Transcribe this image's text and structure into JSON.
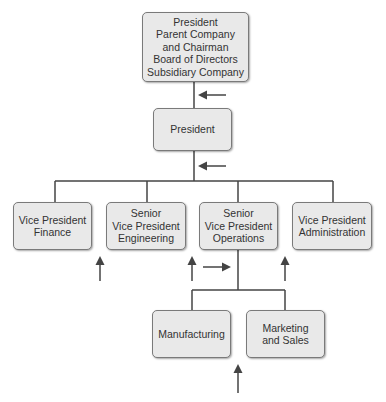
{
  "colors": {
    "box_fill": "#e9e9e9",
    "box_border": "#7a7a7a",
    "line": "#444444",
    "text": "#333333"
  },
  "boxes": {
    "chairman": {
      "label": "President\nParent Company\nand Chairman\nBoard of Directors\nSubsidiary Company"
    },
    "president": {
      "label": "President"
    },
    "vp_finance": {
      "label": "Vice President\nFinance"
    },
    "svp_engineering": {
      "label": "Senior\nVice President\nEngineering"
    },
    "svp_operations": {
      "label": "Senior\nVice President\nOperations"
    },
    "vp_administration": {
      "label": "Vice President\nAdministration"
    },
    "manufacturing": {
      "label": "Manufacturing"
    },
    "marketing_sales": {
      "label": "Marketing\nand Sales"
    }
  },
  "arrows": [
    {
      "direction": "left",
      "near": "chairman-president connector"
    },
    {
      "direction": "left",
      "near": "president-vp connector"
    },
    {
      "direction": "up",
      "near": "vp_finance"
    },
    {
      "direction": "up",
      "near": "svp_engineering"
    },
    {
      "direction": "right",
      "near": "svp_operations"
    },
    {
      "direction": "up",
      "near": "vp_administration"
    },
    {
      "direction": "up",
      "near": "manufacturing/marketing"
    }
  ]
}
